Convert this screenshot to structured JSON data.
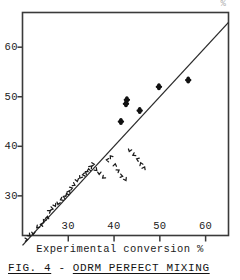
{
  "figure": {
    "caption_prefix": "FIG. 4",
    "caption_dash": "-",
    "caption_title": "ODRM PERFECT MIXING",
    "top_clipped_text": "%"
  },
  "chart_data": {
    "type": "scatter",
    "title": "",
    "xlabel": "Experimental conversion %",
    "ylabel": "",
    "xlim": [
      20,
      65
    ],
    "ylim": [
      22,
      67
    ],
    "xticks": [
      30,
      40,
      50,
      60
    ],
    "yticks": [
      30,
      40,
      50,
      60
    ],
    "xtick_labels": [
      "30",
      "40",
      "50",
      "60"
    ],
    "ytick_labels": [
      "30",
      "40",
      "50",
      "60"
    ],
    "grid": false,
    "legend": "none",
    "reference_line": {
      "name": "parity-line",
      "type": "line",
      "x": [
        20,
        65
      ],
      "y": [
        20,
        65
      ],
      "label": "y = x"
    },
    "series": [
      {
        "name": "small-markers",
        "marker": "small-tick",
        "x": [
          21.0,
          21.6,
          22.4,
          23.2,
          24.0,
          24.6,
          25.4,
          26.0,
          26.6,
          27.2,
          27.8,
          28.4,
          29.0,
          29.6,
          30.2,
          30.8,
          31.4,
          32.0,
          32.6,
          33.2,
          33.8,
          34.4,
          35.0,
          35.6,
          36.2,
          36.8,
          37.6,
          38.4,
          39.2,
          40.2,
          41.0,
          41.8,
          42.6,
          43.4,
          44.2,
          45.0,
          45.8,
          46.6
        ],
        "y": [
          21.2,
          22.0,
          22.3,
          23.6,
          24.2,
          25.1,
          25.8,
          27.0,
          27.4,
          28.0,
          28.3,
          29.2,
          29.8,
          30.4,
          31.0,
          31.6,
          32.2,
          33.0,
          33.6,
          34.2,
          34.8,
          35.4,
          36.0,
          36.4,
          35.2,
          34.4,
          33.6,
          37.2,
          38.0,
          36.4,
          35.2,
          34.0,
          33.2,
          39.0,
          38.2,
          37.4,
          36.6,
          35.8
        ]
      },
      {
        "name": "filled-markers",
        "marker": "filled-ellipse",
        "x": [
          41.5,
          42.6,
          42.8,
          45.6,
          49.8,
          56.2
        ],
        "y": [
          45.0,
          48.6,
          49.4,
          47.2,
          52.0,
          53.4
        ]
      }
    ]
  }
}
